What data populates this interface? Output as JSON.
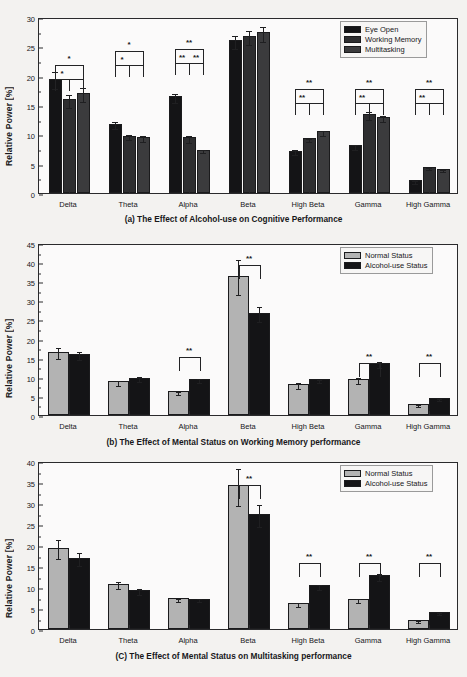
{
  "figure": {
    "panels": [
      "a",
      "b",
      "c"
    ]
  },
  "colors": {
    "black": "#141416",
    "dark_gray": "#2e2e30",
    "mid_gray": "#3b3b3d",
    "light_gray": "#b3b3b3",
    "frame": "#2a2a2c",
    "plot_bg": "#fbfafa",
    "page_bg": "#f3f2f0"
  },
  "panel_a": {
    "caption": "(a) The Effect of  Alcohol-use  on Cognitive Performance",
    "caption_parts": [
      "(a) The Effect of",
      "Alcohol-use",
      "on Cognitive Performance"
    ],
    "legend": {
      "position": "top-right",
      "items": [
        {
          "label": "Eye Open",
          "color": "#141416"
        },
        {
          "label": "Working Memory",
          "color": "#2e2e30"
        },
        {
          "label": "Multitasking",
          "color": "#3b3b3d"
        }
      ]
    },
    "chart_data": {
      "type": "bar",
      "title": "(a) The Effect of  Alcohol-use  on Cognitive Performance",
      "xlabel": "",
      "ylabel": "Relative Power [%]",
      "ylim": [
        0,
        30
      ],
      "yticks": [
        0,
        5,
        10,
        15,
        20,
        25,
        30
      ],
      "grid": false,
      "legend_position": "upper right",
      "categories": [
        "Delta",
        "Theta",
        "Alpha",
        "Beta",
        "High Beta",
        "Gamma",
        "High Gamma"
      ],
      "series": [
        {
          "name": "Eye Open",
          "color": "#141416",
          "values": [
            19.5,
            11.8,
            16.5,
            26.0,
            7.2,
            8.1,
            2.2
          ],
          "errors": [
            1.5,
            0.6,
            0.8,
            1.1,
            0.4,
            0.5,
            0.25
          ]
        },
        {
          "name": "Working Memory",
          "color": "#2e2e30",
          "values": [
            16.0,
            9.8,
            9.5,
            26.8,
            9.3,
            13.5,
            4.4
          ],
          "errors": [
            1.1,
            0.5,
            0.6,
            1.2,
            0.3,
            0.7,
            0.2
          ]
        },
        {
          "name": "Multitasking",
          "color": "#3b3b3d",
          "values": [
            17.0,
            9.6,
            7.4,
            27.4,
            10.5,
            12.9,
            4.1
          ],
          "errors": [
            1.2,
            0.5,
            0.3,
            1.3,
            0.4,
            0.5,
            0.15
          ]
        }
      ],
      "annotations": [
        {
          "group": "Delta",
          "top": "*",
          "inner_left": "*",
          "inner_right": ""
        },
        {
          "group": "Theta",
          "top": "*",
          "inner_left": "*",
          "inner_right": ""
        },
        {
          "group": "Alpha",
          "top": "**",
          "inner_left": "**",
          "inner_right": "**"
        },
        {
          "group": "High Beta",
          "top": "**",
          "inner_left": "**",
          "inner_right": ""
        },
        {
          "group": "Gamma",
          "top": "**",
          "inner_left": "**",
          "inner_right": ""
        },
        {
          "group": "High Gamma",
          "top": "**",
          "inner_left": "**",
          "inner_right": ""
        }
      ]
    }
  },
  "panel_b": {
    "caption": "(b) The Effect of Mental Status on Working Memory performance",
    "legend": {
      "position": "top-right",
      "items": [
        {
          "label": "Normal Status",
          "color": "#b3b3b3"
        },
        {
          "label": "Alcohol-use Status",
          "color": "#141416"
        }
      ]
    },
    "chart_data": {
      "type": "bar",
      "title": "(b) The Effect of Mental Status on Working Memory performance",
      "xlabel": "",
      "ylabel": "Relative Power [%]",
      "ylim": [
        0,
        45
      ],
      "yticks": [
        0,
        5,
        10,
        15,
        20,
        25,
        30,
        35,
        40,
        45
      ],
      "grid": false,
      "legend_position": "upper right",
      "categories": [
        "Delta",
        "Theta",
        "Alpha",
        "Beta",
        "High Beta",
        "Gamma",
        "High Gamma"
      ],
      "series": [
        {
          "name": "Normal Status",
          "color": "#b3b3b3",
          "values": [
            16.6,
            8.8,
            6.2,
            36.5,
            8.0,
            9.5,
            2.8
          ],
          "errors": [
            1.5,
            0.6,
            0.4,
            4.5,
            0.8,
            0.8,
            0.3
          ]
        },
        {
          "name": "Alcohol-use Status",
          "color": "#141416",
          "values": [
            16.0,
            9.8,
            9.5,
            26.8,
            9.4,
            13.5,
            4.4
          ],
          "errors": [
            1.1,
            0.6,
            0.5,
            2.0,
            0.4,
            0.8,
            0.25
          ]
        }
      ],
      "annotations": [
        {
          "group": "Alpha",
          "top": "**"
        },
        {
          "group": "Beta",
          "top": "**"
        },
        {
          "group": "Gamma",
          "top": "**"
        },
        {
          "group": "High Gamma",
          "top": "**"
        }
      ]
    }
  },
  "panel_c": {
    "caption": "(C) The Effect of Mental Status on Multitasking performance",
    "legend": {
      "position": "top-right",
      "items": [
        {
          "label": "Normal Status",
          "color": "#b3b3b3"
        },
        {
          "label": "Alcohol-use Status",
          "color": "#141416"
        }
      ]
    },
    "chart_data": {
      "type": "bar",
      "title": "(C) The Effect of Mental Status on Multitasking performance",
      "xlabel": "",
      "ylabel": "Relative Power [%]",
      "ylim": [
        0,
        40
      ],
      "yticks": [
        0,
        5,
        10,
        15,
        20,
        25,
        30,
        35,
        40
      ],
      "grid": false,
      "legend_position": "upper right",
      "categories": [
        "Delta",
        "Theta",
        "Alpha",
        "Beta",
        "High Beta",
        "Gamma",
        "High Gamma"
      ],
      "series": [
        {
          "name": "Normal Status",
          "color": "#b3b3b3",
          "values": [
            19.4,
            10.8,
            7.3,
            34.2,
            6.1,
            7.1,
            2.1
          ],
          "errors": [
            2.2,
            0.9,
            0.4,
            4.4,
            0.5,
            0.5,
            0.2
          ]
        },
        {
          "name": "Alcohol-use Status",
          "color": "#141416",
          "values": [
            17.0,
            9.3,
            7.2,
            27.3,
            10.4,
            12.8,
            4.0
          ],
          "errors": [
            1.5,
            0.7,
            0.4,
            2.6,
            0.6,
            0.8,
            0.2
          ]
        }
      ],
      "annotations": [
        {
          "group": "Beta",
          "top": "**"
        },
        {
          "group": "High Beta",
          "top": "**"
        },
        {
          "group": "Gamma",
          "top": "**"
        },
        {
          "group": "High Gamma",
          "top": "**"
        }
      ]
    }
  }
}
